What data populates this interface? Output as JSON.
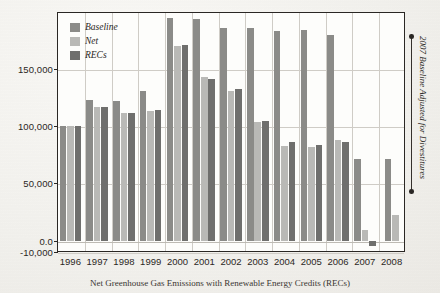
{
  "chart_data": {
    "type": "bar",
    "title": "",
    "caption": "Net Greenhouse Gas Emissions with Renewable Energy Credits (RECs)",
    "xlabel": "",
    "ylabel": "",
    "categories": [
      "1996",
      "1997",
      "1998",
      "1999",
      "2000",
      "2001",
      "2002",
      "2003",
      "2004",
      "2005",
      "2006",
      "2007",
      "2008"
    ],
    "series": [
      {
        "name": "Baseline",
        "color": "#8b8b88",
        "values": [
          100000,
          123000,
          122000,
          131000,
          195000,
          194000,
          186000,
          186000,
          183000,
          184000,
          180000,
          71000,
          71000
        ]
      },
      {
        "name": "Net",
        "color": "#b9b9b6",
        "values": [
          100000,
          117000,
          112000,
          113000,
          170000,
          143000,
          131000,
          104000,
          83000,
          82000,
          88000,
          9000,
          22000
        ]
      },
      {
        "name": "RECs",
        "color": "#6f6f6d",
        "values": [
          100000,
          117000,
          112000,
          114000,
          171000,
          141000,
          133000,
          105000,
          86000,
          84000,
          86000,
          -5000,
          null
        ]
      }
    ],
    "ylim": [
      -10000,
      200000
    ],
    "yticks": [
      -10000,
      0,
      50000,
      100000,
      150000
    ],
    "ytick_labels": [
      "-10,000",
      "0.0",
      "50,000",
      "100,000",
      "150,000"
    ],
    "grid": true,
    "legend_position": "top-left",
    "annotations": [
      {
        "text": "2007 Baseline Adjusted for Divestitures",
        "position": "right-bracket"
      }
    ]
  },
  "legend": {
    "items": [
      {
        "label": "Baseline"
      },
      {
        "label": "Net"
      },
      {
        "label": "RECs"
      }
    ]
  }
}
